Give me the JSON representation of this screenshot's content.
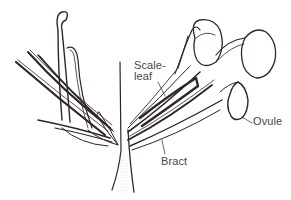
{
  "figure": {
    "type": "botanical line drawing",
    "colors": {
      "ink": "#2e2526",
      "label_text": "#4a4547",
      "stipple": "#6b6466",
      "background": "#ffffff"
    },
    "labels": {
      "scale_leaf_line1": "Scale-",
      "scale_leaf_line2": "leaf",
      "bract": "Bract",
      "ovule": "Ovule"
    }
  }
}
